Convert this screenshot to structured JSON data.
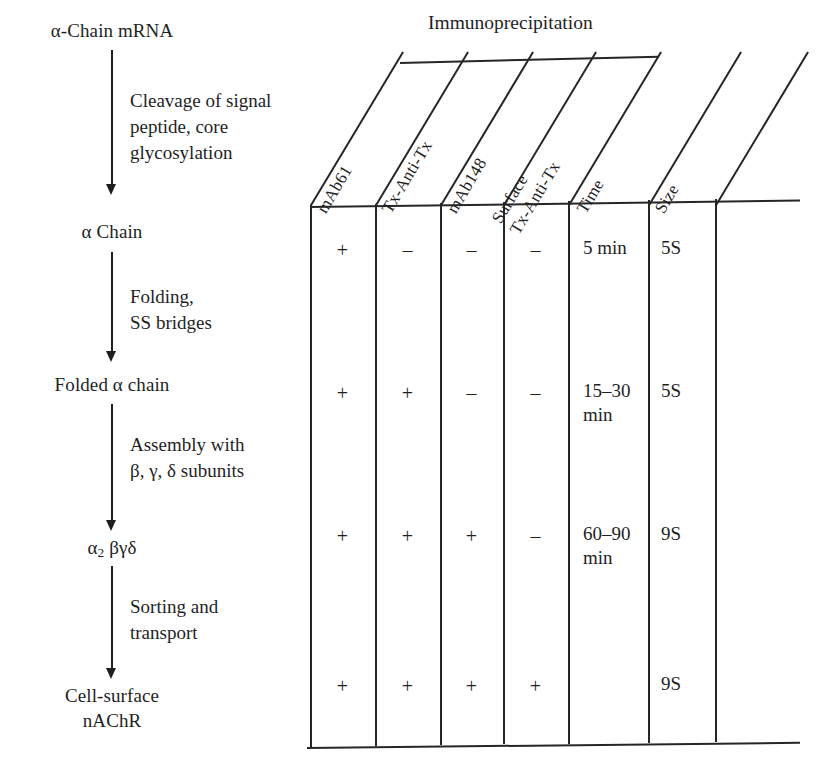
{
  "figure": {
    "type": "biology-pathway-and-table"
  },
  "flow": {
    "stages": [
      {
        "label": "α-Chain mRNA"
      },
      {
        "label": "α Chain"
      },
      {
        "label": "Folded α chain"
      },
      {
        "label": "α_2 βγδ"
      },
      {
        "label": "Cell-surface\nnAChR"
      }
    ],
    "steps": [
      {
        "label": "Cleavage of signal\npeptide, core\nglycosylation"
      },
      {
        "label": "Folding,\nSS bridges"
      },
      {
        "label": "Assembly with\nβ, γ, δ subunits"
      },
      {
        "label": "Sorting and\ntransport"
      }
    ]
  },
  "table": {
    "spanner": {
      "label": "Immunoprecipitation",
      "covers": [
        "mAb61",
        "Tx-Anti-Tx",
        "mAb148",
        "Surface Tx-Anti-Tx"
      ]
    },
    "columns": [
      {
        "label": "mAb61"
      },
      {
        "label": "Tx-Anti-Tx"
      },
      {
        "label": "mAb148"
      },
      {
        "label": "Surface\nTx-Anti-Tx"
      },
      {
        "label": "Time"
      },
      {
        "label": "Size"
      }
    ],
    "rows": [
      {
        "mAb61": "+",
        "tx_anti_tx": "–",
        "mAb148": "–",
        "surface": "–",
        "time": "5 min",
        "size": "5S"
      },
      {
        "mAb61": "+",
        "tx_anti_tx": "+",
        "mAb148": "–",
        "surface": "–",
        "time": "15–30\nmin",
        "size": "5S"
      },
      {
        "mAb61": "+",
        "tx_anti_tx": "+",
        "mAb148": "+",
        "surface": "–",
        "time": "60–90\nmin",
        "size": "9S"
      },
      {
        "mAb61": "+",
        "tx_anti_tx": "+",
        "mAb148": "+",
        "surface": "+",
        "time": "",
        "size": "9S"
      }
    ]
  },
  "colors": {
    "ink": "#1f1f1f",
    "rule": "#262626",
    "background": "#ffffff"
  }
}
